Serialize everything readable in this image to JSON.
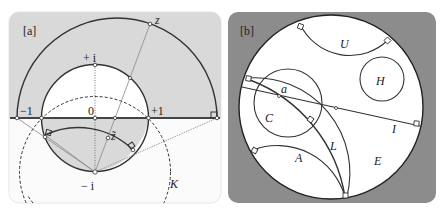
{
  "figure": {
    "panels": [
      {
        "tag": "[a]",
        "labels": {
          "plus_i": "+ i",
          "minus_i": "− i",
          "zero": "0",
          "minus_one": "−1",
          "plus_one": "+1",
          "z": "z",
          "z_tilde": "z̃",
          "K": "K"
        },
        "colors": {
          "shade": "#d9d9d9",
          "stroke": "#333333",
          "thin": "#777777"
        }
      },
      {
        "tag": "[b]",
        "labels": {
          "U": "U",
          "H": "H",
          "a": "a",
          "C": "C",
          "I": "I",
          "L": "L",
          "A": "A",
          "E": "E"
        },
        "colors": {
          "background": "#8c8c8c",
          "disk": "#ffffff",
          "stroke": "#333333"
        }
      }
    ]
  }
}
